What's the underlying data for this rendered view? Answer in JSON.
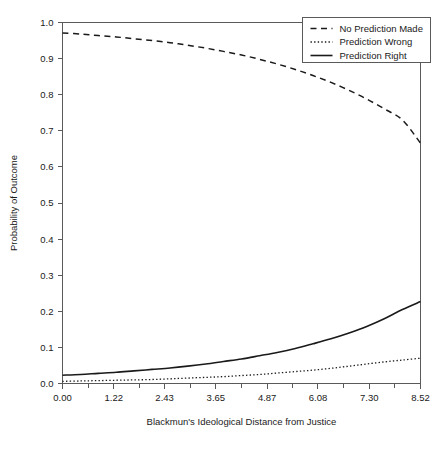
{
  "chart_data": {
    "type": "line",
    "title": "",
    "xlabel": "Blackmun's Ideological Distance from Justice",
    "ylabel": "Probability of Outcome",
    "xlim": [
      0.0,
      8.52
    ],
    "ylim": [
      0.0,
      1.0
    ],
    "grid": false,
    "legend_position": "top-right",
    "xticks": [
      0.0,
      1.22,
      2.43,
      3.65,
      4.87,
      6.08,
      7.3,
      8.52
    ],
    "xticklabels": [
      "0.00",
      "1.22",
      "2.43",
      "3.65",
      "4.87",
      "6.08",
      "7.30",
      "8.52"
    ],
    "xminorticks": [
      0.61,
      1.825,
      3.04,
      4.26,
      5.475,
      6.69,
      7.91
    ],
    "yticks": [
      0.0,
      0.1,
      0.2,
      0.3,
      0.4,
      0.5,
      0.6,
      0.7,
      0.8,
      0.9,
      1.0
    ],
    "yticklabels": [
      "0.0",
      "0.1",
      "0.2",
      "0.3",
      "0.4",
      "0.5",
      "0.6",
      "0.7",
      "0.8",
      "0.9",
      "1.0"
    ],
    "x": [
      0.0,
      0.43,
      0.85,
      1.28,
      1.7,
      2.13,
      2.56,
      2.98,
      3.41,
      3.83,
      4.26,
      4.69,
      5.11,
      5.54,
      5.96,
      6.39,
      6.82,
      7.24,
      7.67,
      8.09,
      8.52
    ],
    "series": [
      {
        "name": "No Prediction Made",
        "style": "dashed",
        "color": "#1a1a1a",
        "values": [
          0.971,
          0.968,
          0.964,
          0.96,
          0.955,
          0.95,
          0.944,
          0.937,
          0.929,
          0.92,
          0.91,
          0.898,
          0.885,
          0.87,
          0.853,
          0.834,
          0.812,
          0.788,
          0.76,
          0.73,
          0.666
        ]
      },
      {
        "name": "Prediction Wrong",
        "style": "dotted",
        "color": "#1a1a1a",
        "values": [
          0.006,
          0.007,
          0.008,
          0.009,
          0.01,
          0.011,
          0.013,
          0.015,
          0.017,
          0.019,
          0.022,
          0.025,
          0.029,
          0.033,
          0.037,
          0.042,
          0.048,
          0.054,
          0.06,
          0.065,
          0.07
        ]
      },
      {
        "name": "Prediction Right",
        "style": "solid",
        "color": "#1a1a1a",
        "values": [
          0.023,
          0.025,
          0.028,
          0.031,
          0.035,
          0.039,
          0.043,
          0.048,
          0.054,
          0.061,
          0.068,
          0.077,
          0.086,
          0.097,
          0.11,
          0.124,
          0.14,
          0.158,
          0.18,
          0.205,
          0.227
        ]
      }
    ]
  },
  "legend": {
    "items": [
      {
        "label": "No Prediction Made"
      },
      {
        "label": "Prediction Wrong"
      },
      {
        "label": "Prediction Right"
      }
    ]
  },
  "colors": {
    "ink": "#1a1a1a",
    "frame": "#5a5a5a",
    "background": "#ffffff"
  }
}
